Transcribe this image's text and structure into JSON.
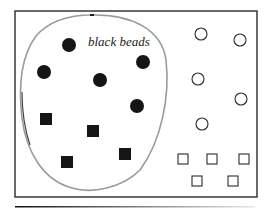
{
  "diagram": {
    "set_label": "black beads",
    "colors": {
      "frame": "#1a1a1a",
      "loop": "#9a9a9a",
      "black_bead": "#151515",
      "white_bead_stroke": "#2a2a2a",
      "white_bead_fill": "#ffffff"
    },
    "inside_set": {
      "black_circles": 5,
      "black_squares": 4
    },
    "outside_set": {
      "white_circles": 5,
      "white_squares": 5
    }
  }
}
